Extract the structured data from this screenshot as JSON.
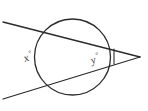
{
  "figure": {
    "type": "geometry-diagram",
    "width": 148,
    "height": 111,
    "background_color": "#ffffff",
    "stroke_color": "#2b2b2b",
    "label_color": "#3a3a3a"
  },
  "labels": {
    "arc_far": {
      "variable": "x",
      "degree_symbol": "°",
      "text": "x°",
      "position": "inside circle, left side",
      "rotation_deg": -20
    },
    "arc_near": {
      "variable": "y",
      "degree_symbol": "°",
      "text": "y°",
      "position": "inside circle, right side",
      "rotation_deg": -20
    }
  },
  "shapes": {
    "circle": {
      "name": "circle",
      "cx": 72.5,
      "cy": 57,
      "r": 38,
      "stroke_width": 1.3
    },
    "secant_upper": {
      "name": "upper-secant-line",
      "x1": 3,
      "y1": 22,
      "x2": 140,
      "y2": 57,
      "stroke_width": 1.3
    },
    "secant_lower": {
      "name": "lower-secant-line",
      "x1": 3,
      "y1": 99,
      "x2": 140,
      "y2": 57,
      "stroke_width": 1.3
    },
    "vertex_tick": {
      "name": "vertex-angle-tick",
      "x1": 114,
      "y1": 49,
      "x2": 114,
      "y2": 64,
      "stroke_width": 1.1
    }
  }
}
